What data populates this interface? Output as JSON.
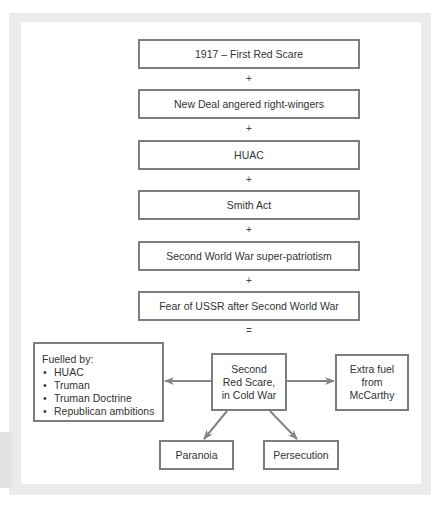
{
  "diagram": {
    "stack": [
      {
        "label": "1917 – First Red Scare"
      },
      {
        "label": "New Deal angered right-wingers"
      },
      {
        "label": "HUAC"
      },
      {
        "label": "Smith Act"
      },
      {
        "label": "Second World War super-patriotism"
      },
      {
        "label": "Fear of USSR after Second World War"
      }
    ],
    "operators": [
      "+",
      "+",
      "+",
      "+",
      "+",
      "="
    ],
    "center": {
      "lines": [
        "Second",
        "Red Scare,",
        "in Cold War"
      ]
    },
    "fuelled_by": {
      "heading": "Fuelled by:",
      "bullet": "•",
      "items": [
        "HUAC",
        "Truman",
        "Truman Doctrine",
        "Republican ambitions"
      ]
    },
    "extra_fuel": {
      "lines": [
        "Extra fuel",
        "from",
        "McCarthy"
      ]
    },
    "outcomes": [
      {
        "label": "Paranoia"
      },
      {
        "label": "Persecution"
      }
    ],
    "colors": {
      "box_border": "#7d7d7d",
      "arrow": "#858585",
      "text": "#333333",
      "frame": "#ebebeb"
    }
  }
}
